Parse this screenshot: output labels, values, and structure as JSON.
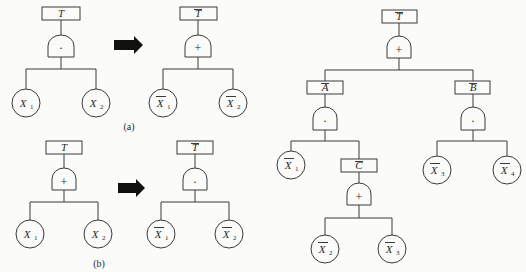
{
  "captions": {
    "a": "(a)",
    "b": "(b)"
  },
  "colors": {
    "line": "#3a3a3a",
    "arrow": "#111111",
    "background": "#fbfbfa"
  },
  "diagram_a": {
    "original": {
      "top_event": {
        "label": "T",
        "negated": false
      },
      "gate": {
        "type": "AND",
        "symbol": "·"
      },
      "basic_events": [
        {
          "label": "X",
          "sub": "1",
          "negated": false
        },
        {
          "label": "X",
          "sub": "2",
          "negated": false
        }
      ]
    },
    "transformation_arrow": "right-arrow",
    "dual": {
      "top_event": {
        "label": "T",
        "negated": true
      },
      "gate": {
        "type": "OR",
        "symbol": "+"
      },
      "basic_events": [
        {
          "label": "X",
          "sub": "1",
          "negated": true
        },
        {
          "label": "X",
          "sub": "2",
          "negated": true
        }
      ]
    }
  },
  "diagram_b": {
    "original": {
      "top_event": {
        "label": "T",
        "negated": false
      },
      "gate": {
        "type": "OR",
        "symbol": "+"
      },
      "basic_events": [
        {
          "label": "X",
          "sub": "1",
          "negated": false
        },
        {
          "label": "X",
          "sub": "2",
          "negated": false
        }
      ]
    },
    "transformation_arrow": "right-arrow",
    "dual": {
      "top_event": {
        "label": "T",
        "negated": true
      },
      "gate": {
        "type": "AND",
        "symbol": "·"
      },
      "basic_events": [
        {
          "label": "X",
          "sub": "1",
          "negated": true
        },
        {
          "label": "X",
          "sub": "2",
          "negated": true
        }
      ]
    }
  },
  "success_tree": {
    "top_event": {
      "label": "T",
      "negated": true
    },
    "top_gate": {
      "type": "OR",
      "symbol": "+"
    },
    "intermediate_A": {
      "label": "A",
      "negated": true,
      "gate": {
        "type": "AND",
        "symbol": "·"
      },
      "children": [
        {
          "label": "X",
          "sub": "1",
          "negated": true
        },
        {
          "label": "C",
          "negated": true,
          "gate": {
            "type": "OR",
            "symbol": "+"
          },
          "children": [
            {
              "label": "X",
              "sub": "2",
              "negated": true
            },
            {
              "label": "X",
              "sub": "3",
              "negated": true
            }
          ]
        }
      ]
    },
    "intermediate_B": {
      "label": "B",
      "negated": true,
      "gate": {
        "type": "AND",
        "symbol": "·"
      },
      "children": [
        {
          "label": "X",
          "sub": "3",
          "negated": true
        },
        {
          "label": "X",
          "sub": "4",
          "negated": true
        }
      ]
    }
  }
}
